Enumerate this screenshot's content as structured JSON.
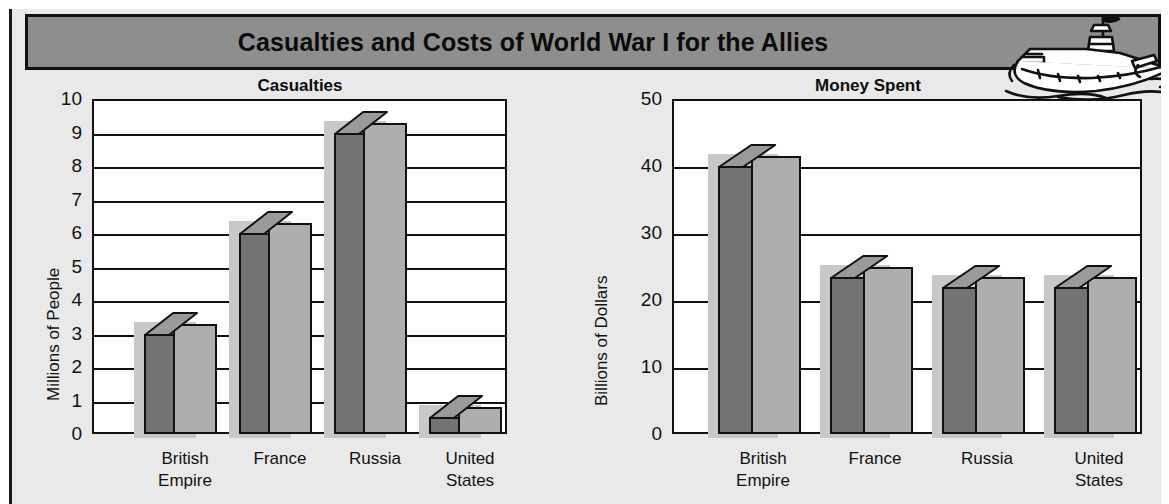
{
  "header": {
    "title": "Casualties and Costs of World War I for the Allies",
    "icon": "battleship-icon"
  },
  "chart_data": [
    {
      "type": "bar",
      "title": "Casualties",
      "xlabel": "",
      "ylabel": "Millions of People",
      "categories": [
        "British Empire",
        "France",
        "Russia",
        "United States"
      ],
      "values": [
        3,
        6,
        9,
        0.5
      ],
      "yticks": [
        "0",
        "1",
        "2",
        "3",
        "4",
        "5",
        "6",
        "7",
        "8",
        "9",
        "10"
      ],
      "ylim": [
        0,
        10
      ],
      "grid": true,
      "legend": "none",
      "style": "3d-column"
    },
    {
      "type": "bar",
      "title": "Money Spent",
      "xlabel": "",
      "ylabel": "Billions of Dollars",
      "categories": [
        "British Empire",
        "France",
        "Russia",
        "United States"
      ],
      "values": [
        40,
        23.5,
        22,
        22
      ],
      "yticks": [
        "0",
        "10",
        "20",
        "30",
        "40",
        "50"
      ],
      "ylim": [
        0,
        50
      ],
      "grid": true,
      "legend": "none",
      "style": "3d-column"
    }
  ],
  "colors": {
    "titlebar": "#8e8e8e",
    "background": "#e9e9e9",
    "plot": "#ffffff",
    "bar_front": "#aeaeae",
    "bar_side": "#737373",
    "bar_top": "#9a9a9a",
    "outline": "#111111"
  }
}
